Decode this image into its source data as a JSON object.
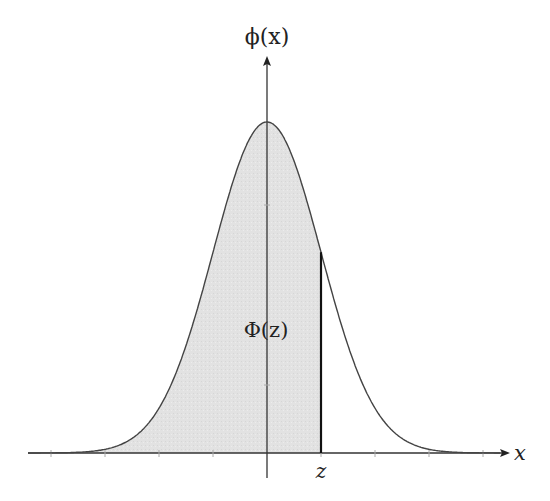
{
  "figure": {
    "y_axis_label": "ϕ(x)",
    "x_axis_label": "x",
    "z_label": "z",
    "area_label": "Φ(z)",
    "colors": {
      "background": "#ffffff",
      "curve": "#444444",
      "shade": "#e3e3e3",
      "axis": "#333333",
      "z_line": "#111111"
    }
  },
  "chart_data": {
    "type": "area",
    "title": "",
    "xlabel": "x",
    "ylabel": "ϕ(x)",
    "function": "standard normal pdf",
    "mean": 0,
    "sd": 1,
    "shaded_region": {
      "from": "-inf",
      "to": "z",
      "label": "Φ(z)"
    },
    "z_value_approx": 1.0,
    "x_range": [
      -4.5,
      4.5
    ],
    "ticks_sigma": [
      -4,
      -3,
      -2,
      -1,
      0,
      1,
      2,
      3,
      4
    ],
    "grid": false,
    "legend": "none"
  }
}
